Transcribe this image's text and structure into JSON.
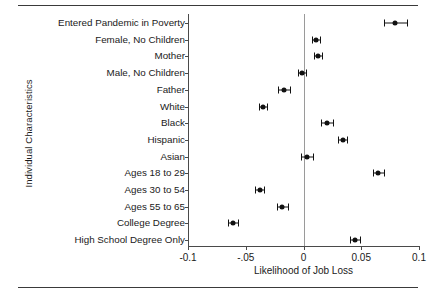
{
  "figure": {
    "has_top_rule": true,
    "has_bottom_rule": true,
    "background": "#ffffff",
    "marker_color": "#111111",
    "axis_color": "#4a4a4a",
    "zeroline_color": "#9a9a9a"
  },
  "chart_data": {
    "type": "scatter",
    "orientation": "horizontal",
    "title": "",
    "xlabel": "Likelihood of Job Loss",
    "ylabel": "Individual Characteristics",
    "xlim": [
      -0.1,
      0.1
    ],
    "xticks": [
      -0.1,
      -0.05,
      0,
      0.05,
      0.1
    ],
    "xticklabels": [
      "-0.1",
      "-.05",
      "0",
      "0.05",
      "0.1"
    ],
    "grid": false,
    "legend": "none",
    "reference_line": 0,
    "categories": [
      "Entered Pandemic in Poverty",
      "Female, No Children",
      "Mother",
      "Male, No Children",
      "Father",
      "White",
      "Black",
      "Hispanic",
      "Asian",
      "Ages 18 to 29",
      "Ages 30 to 54",
      "Ages 55 to 65",
      "College Degree",
      "High School Degree Only"
    ],
    "values": [
      0.0795,
      0.0108,
      0.0125,
      -0.0013,
      -0.017,
      -0.0352,
      0.0202,
      0.0338,
      0.003,
      0.0648,
      -0.038,
      -0.0182,
      -0.061,
      0.0448
    ],
    "ci_low": [
      0.0695,
      0.0073,
      0.009,
      -0.0048,
      -0.022,
      -0.0387,
      0.0152,
      0.0298,
      -0.0022,
      0.0603,
      -0.042,
      -0.0227,
      -0.0655,
      0.0403
    ],
    "ci_high": [
      0.0895,
      0.0143,
      0.016,
      0.0022,
      -0.012,
      -0.0317,
      0.0252,
      0.0378,
      0.0082,
      0.0693,
      -0.034,
      -0.0137,
      -0.0565,
      0.0493
    ],
    "series": [
      {
        "name": "Point estimate with 95% confidence interval",
        "values": [
          0.0795,
          0.0108,
          0.0125,
          -0.0013,
          -0.017,
          -0.0352,
          0.0202,
          0.0338,
          0.003,
          0.0648,
          -0.038,
          -0.0182,
          -0.061,
          0.0448
        ]
      }
    ]
  }
}
